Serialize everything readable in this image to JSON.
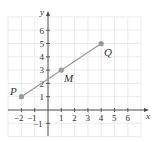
{
  "diagram": {
    "type": "coordinate-plane",
    "axes": {
      "x_label": "x",
      "y_label": "y"
    },
    "x_ticks": [
      {
        "value": -2,
        "label": "−2"
      },
      {
        "value": -1,
        "label": "−1"
      },
      {
        "value": 1,
        "label": "1"
      },
      {
        "value": 2,
        "label": "2"
      },
      {
        "value": 3,
        "label": "3"
      },
      {
        "value": 4,
        "label": "4"
      },
      {
        "value": 5,
        "label": "5"
      },
      {
        "value": 6,
        "label": "6"
      }
    ],
    "y_ticks": [
      {
        "value": -1,
        "label": "−1"
      },
      {
        "value": 1,
        "label": "1"
      },
      {
        "value": 2,
        "label": "2"
      },
      {
        "value": 3,
        "label": "3"
      },
      {
        "value": 4,
        "label": "4"
      },
      {
        "value": 5,
        "label": "5"
      },
      {
        "value": 6,
        "label": "6"
      }
    ],
    "points": [
      {
        "name": "P",
        "x": -2,
        "y": 1
      },
      {
        "name": "M",
        "x": 1,
        "y": 3
      },
      {
        "name": "Q",
        "x": 4,
        "y": 5
      }
    ],
    "segment": {
      "from": "P",
      "to": "Q"
    },
    "colors": {
      "grid": "#e6e6e6",
      "axis": "#4a4a4a",
      "segment": "#9a9a9a"
    }
  }
}
